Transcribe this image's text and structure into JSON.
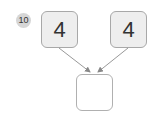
{
  "problem": {
    "number": "10",
    "inputs": [
      {
        "value": "4"
      },
      {
        "value": "4"
      }
    ],
    "result": {
      "value": ""
    }
  },
  "colors": {
    "box_fill": "#eeeeee",
    "box_border": "#a8a8a8",
    "badge_fill": "#d6d6d6",
    "arrow": "#999999"
  }
}
